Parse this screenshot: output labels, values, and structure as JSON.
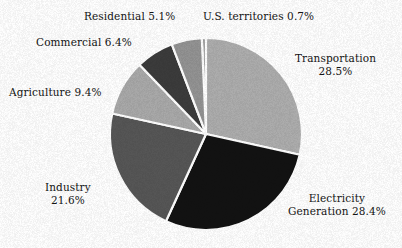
{
  "chart_data": {
    "type": "pie",
    "title": "",
    "subtitle": "",
    "xlabel": "",
    "ylabel": "",
    "legend_position": "none",
    "grid": false,
    "units": "percent",
    "total": 100.1,
    "start_angle_deg": -92.5,
    "direction": "clockwise",
    "categories": [
      "U.S. territories",
      "Transportation",
      "Electricity Generation",
      "Industry",
      "Agriculture",
      "Commercial",
      "Residential"
    ],
    "values": [
      0.7,
      28.5,
      28.4,
      21.6,
      9.4,
      6.4,
      5.1
    ],
    "slices": [
      {
        "name": "us-territories",
        "label": "U.S. territories",
        "value": 0.7,
        "value_text": "0.7%",
        "label_text": "U.S. territories 0.7%",
        "color": "#9a9a9a"
      },
      {
        "name": "transportation",
        "label": "Transportation",
        "value": 28.5,
        "value_text": "28.5%",
        "label_line1": "Transportation",
        "label_line2": "28.5%",
        "color": "#adadad"
      },
      {
        "name": "electricity-generation",
        "label": "Electricity Generation",
        "value": 28.4,
        "value_text": "28.4%",
        "label_line1": "Electricity",
        "label_line2": "Generation 28.4%",
        "color": "#121212"
      },
      {
        "name": "industry",
        "label": "Industry",
        "value": 21.6,
        "value_text": "21.6%",
        "label_line1": "Industry",
        "label_line2": "21.6%",
        "color": "#565656"
      },
      {
        "name": "agriculture",
        "label": "Agriculture",
        "value": 9.4,
        "value_text": "9.4%",
        "label_text": "Agriculture 9.4%",
        "color": "#a9a9a9"
      },
      {
        "name": "commercial",
        "label": "Commercial",
        "value": 6.4,
        "value_text": "6.4%",
        "label_text": "Commercial 6.4%",
        "color": "#3b3b3b"
      },
      {
        "name": "residential",
        "label": "Residential",
        "value": 5.1,
        "value_text": "5.1%",
        "label_text": "Residential 5.1%",
        "color": "#939393"
      }
    ],
    "geometry": {
      "center_x": 206,
      "center_y": 134,
      "radius": 96,
      "separator_color": "#ffffff",
      "separator_width": 2.2
    },
    "background_color": "#ffffff",
    "text_color": "#141414"
  }
}
